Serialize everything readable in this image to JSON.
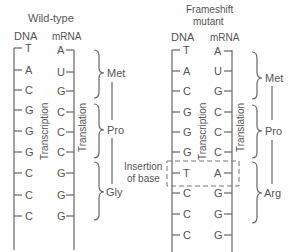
{
  "wild_type": {
    "title": "Wild-type",
    "dna_header": "DNA",
    "mrna_header": "mRNA",
    "dna": [
      "T",
      "A",
      "C",
      "G",
      "G",
      "G",
      "C",
      "C",
      "C"
    ],
    "mrna": [
      "A",
      "U",
      "G",
      "C",
      "C",
      "C",
      "G",
      "G",
      "G"
    ],
    "transcription_label": "Transcription",
    "translation_label": "Translation",
    "codons": [
      "Met",
      "Pro",
      "Gly"
    ]
  },
  "mutant": {
    "title_line1": "Frameshift",
    "title_line2": "mutant",
    "dna_header": "DNA",
    "mrna_header": "mRNA",
    "dna": [
      "T",
      "A",
      "C",
      "G",
      "G",
      "G",
      "T",
      "C",
      "C",
      "C"
    ],
    "mrna": [
      "A",
      "U",
      "G",
      "C",
      "C",
      "C",
      "A",
      "G",
      "G",
      "G"
    ],
    "transcription_label": "Transcription",
    "translation_label": "Translation",
    "codons": [
      "Met",
      "Pro",
      "Arg"
    ],
    "insertion_label_line1": "Insertion",
    "insertion_label_line2": "of base"
  },
  "colors": {
    "ink": "#555555",
    "background": "#ffffff"
  }
}
